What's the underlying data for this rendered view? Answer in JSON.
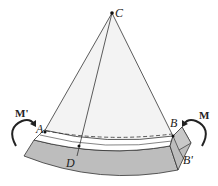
{
  "diagram": {
    "labels": {
      "center": "C",
      "point_a": "A",
      "point_b": "B",
      "point_d": "D",
      "point_b_prime": "B'",
      "moment_left": "M'",
      "moment_right": "M"
    },
    "colors": {
      "sector_fill": "#f2f2f2",
      "beam_fill": "#bdbdbd",
      "line": "#333333"
    }
  }
}
